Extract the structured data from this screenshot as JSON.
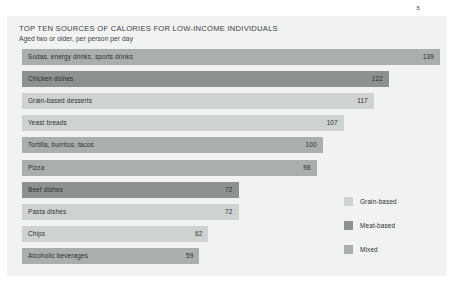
{
  "corner_mark": "B",
  "chart_data": {
    "type": "bar",
    "orientation": "horizontal",
    "title": "TOP TEN SOURCES OF CALORIES FOR LOW-INCOME INDIVIDUALS",
    "subtitle": "Aged two or older, per person per day",
    "xlabel": "",
    "ylabel": "",
    "grid": false,
    "xlim": [
      0,
      139
    ],
    "legend_position": "right-bottom",
    "categories": [
      "Sodas, energy drinks, sports drinks",
      "Chicken dishes",
      "Grain-based desserts",
      "Yeast breads",
      "Tortilla, burritos, tacos",
      "Pizza",
      "Beef dishes",
      "Pasta dishes",
      "Chips",
      "Alcoholic beverages"
    ],
    "values": [
      139,
      122,
      117,
      107,
      100,
      98,
      72,
      72,
      62,
      59
    ],
    "groups": [
      "Mixed",
      "Meat-based",
      "Grain-based",
      "Grain-based",
      "Mixed",
      "Mixed",
      "Meat-based",
      "Grain-based",
      "Grain-based",
      "Mixed"
    ],
    "legend": [
      {
        "label": "Grain-based",
        "color": "#ced2d1"
      },
      {
        "label": "Meat-based",
        "color": "#8d9290"
      },
      {
        "label": "Mixed",
        "color": "#aaaeac"
      }
    ],
    "colors": {
      "Grain-based": "#ced2d1",
      "Meat-based": "#8d9290",
      "Mixed": "#aaaeac"
    },
    "panel_color": "#f1f2f2"
  }
}
